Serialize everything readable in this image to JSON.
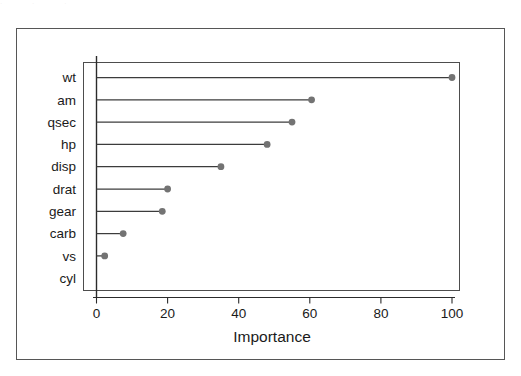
{
  "figure": {
    "scan_artifact_top": "·                    ·                    ·",
    "frame_color": "#565656",
    "panel_color": "#4d4d4d",
    "background": "#ffffff"
  },
  "chart_data": {
    "type": "bar",
    "subtype": "lollipop-dotchart",
    "title": "",
    "subtitle": "",
    "xlabel": "Importance",
    "ylabel": "",
    "categories": [
      "wt",
      "am",
      "qsec",
      "hp",
      "disp",
      "drat",
      "gear",
      "carb",
      "vs",
      "cyl"
    ],
    "values": [
      100,
      60.5,
      55,
      48,
      35,
      20,
      18.5,
      7.5,
      2.3,
      0
    ],
    "xlim": [
      0,
      107
    ],
    "xticks": [
      0,
      20,
      40,
      60,
      80,
      100
    ],
    "xtick_labels": [
      "0",
      "20",
      "40",
      "60",
      "80",
      "100"
    ],
    "grid": false,
    "legend": null,
    "legend_position": "none",
    "orientation": "horizontal",
    "series": [
      {
        "name": "Importance",
        "values": [
          100,
          60.5,
          55,
          48,
          35,
          20,
          18.5,
          7.5,
          2.3,
          0
        ]
      }
    ],
    "colors": {
      "point": "#737373",
      "stem": "#3c3c3c",
      "axis": "#2b2b2b",
      "panel_border": "#4d4d4d",
      "text": "#1a1a1a"
    },
    "point_radius": 3.4
  }
}
